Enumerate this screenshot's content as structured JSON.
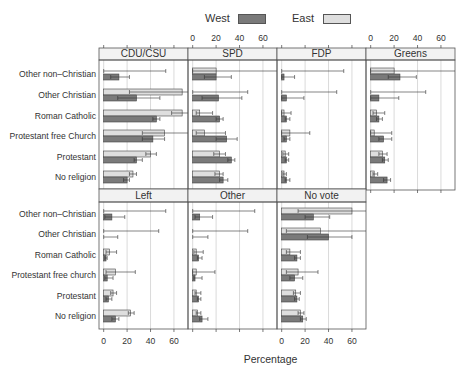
{
  "legend": {
    "items": [
      {
        "label": "West",
        "color": "#7a7a7a"
      },
      {
        "label": "East",
        "color": "#dedede"
      }
    ]
  },
  "colors": {
    "west": "#7a7a7a",
    "east": "#dedede",
    "strip": "#f2f2f2",
    "border": "#555555",
    "grid": "#cccccc"
  },
  "axis": {
    "xlabel": "Percentage",
    "ticks": [
      0,
      20,
      40,
      60
    ],
    "tick_labels": [
      "0",
      "20",
      "40",
      "60"
    ]
  },
  "rows": {
    "upper": [
      "Other non–Christian",
      "Other Christian",
      "Roman Catholic",
      "Protestant free Church",
      "Protestant",
      "No religion"
    ],
    "lower": [
      "Other non–Christian",
      "Other Christian",
      "Roman Catholic",
      "Protestant free church",
      "Protestant",
      "No religion"
    ]
  },
  "chart_data": {
    "type": "bar",
    "orientation": "horizontal",
    "title": "",
    "xlabel": "Percentage",
    "ylabel": "",
    "xlim": [
      -4,
      72
    ],
    "grid": true,
    "legend_position": "top",
    "series_names": [
      "West",
      "East"
    ],
    "categories": [
      "Other non–Christian",
      "Other Christian",
      "Roman Catholic",
      "Protestant free Church",
      "Protestant",
      "No religion"
    ],
    "panels": [
      {
        "name": "CDU/CSU",
        "east": [
          0,
          67,
          67,
          52,
          40,
          25
        ],
        "east_lo": [
          0,
          22,
          58,
          33,
          36,
          22
        ],
        "east_hi": [
          53,
          72,
          72,
          72,
          45,
          28
        ],
        "west": [
          13,
          28,
          45,
          42,
          28,
          20
        ],
        "west_lo": [
          6,
          12,
          42,
          33,
          26,
          17
        ],
        "west_hi": [
          22,
          48,
          48,
          52,
          33,
          22
        ]
      },
      {
        "name": "SPD",
        "east": [
          20,
          0,
          6,
          10,
          23,
          23
        ],
        "east_lo": [
          0,
          0,
          3,
          3,
          18,
          19
        ],
        "east_hi": [
          72,
          47,
          17,
          28,
          28,
          26
        ],
        "west": [
          20,
          22,
          23,
          29,
          33,
          26
        ],
        "west_lo": [
          10,
          8,
          20,
          20,
          30,
          23
        ],
        "west_hi": [
          33,
          42,
          26,
          38,
          36,
          30
        ]
      },
      {
        "name": "FDP",
        "east": [
          0,
          0,
          2,
          7,
          3,
          2
        ],
        "east_lo": [
          0,
          0,
          0,
          0,
          1,
          1
        ],
        "east_hi": [
          53,
          47,
          8,
          24,
          6,
          4
        ],
        "west": [
          2,
          4,
          4,
          4,
          4,
          4
        ],
        "west_lo": [
          0,
          0,
          3,
          2,
          3,
          3
        ],
        "west_hi": [
          11,
          19,
          7,
          7,
          6,
          7
        ]
      },
      {
        "name": "Greens",
        "east": [
          20,
          0,
          5,
          3,
          10,
          3
        ],
        "east_lo": [
          0,
          0,
          2,
          0,
          7,
          2
        ],
        "east_hi": [
          72,
          47,
          12,
          18,
          14,
          6
        ],
        "west": [
          25,
          7,
          7,
          11,
          12,
          14
        ],
        "west_lo": [
          15,
          0,
          5,
          7,
          10,
          11
        ],
        "west_hi": [
          39,
          24,
          10,
          18,
          15,
          17
        ]
      },
      {
        "name": "Left",
        "east": [
          0,
          0,
          5,
          10,
          8,
          23
        ],
        "east_lo": [
          0,
          0,
          2,
          2,
          6,
          21
        ],
        "east_hi": [
          53,
          47,
          11,
          27,
          11,
          26
        ],
        "west": [
          7,
          0,
          2,
          3,
          4,
          10
        ],
        "west_lo": [
          1,
          0,
          1,
          1,
          2,
          7
        ],
        "west_hi": [
          18,
          12,
          3,
          8,
          7,
          13
        ],
        "note": "Other Christian West: no bar, error to ~12"
      },
      {
        "name": "Other",
        "east": [
          0,
          0,
          3,
          3,
          3,
          4
        ],
        "east_lo": [
          0,
          0,
          1,
          0,
          2,
          3
        ],
        "east_hi": [
          53,
          47,
          9,
          19,
          7,
          7
        ],
        "west": [
          6,
          0,
          5,
          2,
          5,
          8
        ],
        "west_lo": [
          2,
          0,
          4,
          1,
          4,
          6
        ],
        "west_hi": [
          17,
          13,
          8,
          8,
          7,
          13
        ]
      },
      {
        "name": "No vote",
        "east": [
          60,
          33,
          7,
          14,
          12,
          16
        ],
        "east_lo": [
          14,
          4,
          4,
          4,
          10,
          14
        ],
        "east_hi": [
          72,
          72,
          16,
          31,
          16,
          19
        ],
        "west": [
          27,
          40,
          13,
          11,
          13,
          18
        ],
        "west_lo": [
          20,
          22,
          11,
          7,
          11,
          16
        ],
        "west_hi": [
          41,
          60,
          16,
          18,
          15,
          21
        ]
      }
    ]
  }
}
